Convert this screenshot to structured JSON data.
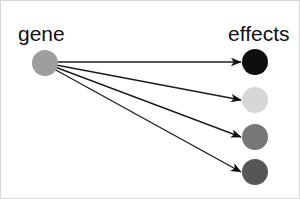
{
  "canvas": {
    "width": 300,
    "height": 199,
    "background_color": "#ffffff",
    "border_color": "#d9d9d9"
  },
  "labels": {
    "source_label": "gene",
    "target_label": "effects"
  },
  "chart_data": {
    "type": "diagram",
    "title": "gene",
    "subtitle": "effects",
    "nodes": [
      {
        "id": "gene",
        "label": "gene",
        "group": "source",
        "x": 45,
        "y": 63,
        "r": 13,
        "color": "#9e9e9e"
      },
      {
        "id": "effect-1",
        "label": "",
        "group": "effect",
        "x": 255,
        "y": 62,
        "r": 13,
        "color": "#0d0d0d"
      },
      {
        "id": "effect-2",
        "label": "",
        "group": "effect",
        "x": 255,
        "y": 100,
        "r": 13,
        "color": "#d6d6d6"
      },
      {
        "id": "effect-3",
        "label": "",
        "group": "effect",
        "x": 255,
        "y": 137,
        "r": 13,
        "color": "#777777"
      },
      {
        "id": "effect-4",
        "label": "",
        "group": "effect",
        "x": 255,
        "y": 172,
        "r": 13,
        "color": "#565656"
      }
    ],
    "edges": [
      {
        "from": "gene",
        "to": "effect-1",
        "x1": 57,
        "y1": 62,
        "x2": 241,
        "y2": 62
      },
      {
        "from": "gene",
        "to": "effect-2",
        "x1": 56,
        "y1": 65,
        "x2": 241,
        "y2": 100
      },
      {
        "from": "gene",
        "to": "effect-3",
        "x1": 55,
        "y1": 67,
        "x2": 241,
        "y2": 137
      },
      {
        "from": "gene",
        "to": "effect-4",
        "x1": 54,
        "y1": 69,
        "x2": 241,
        "y2": 172
      }
    ],
    "label_positions": [
      {
        "text": "gene",
        "x": 18,
        "y": 41
      },
      {
        "text": "effects",
        "x": 228,
        "y": 41
      }
    ],
    "edge_color": "#1c1c1c",
    "arrowhead_color": "#111111",
    "legend": null,
    "grid": false
  }
}
